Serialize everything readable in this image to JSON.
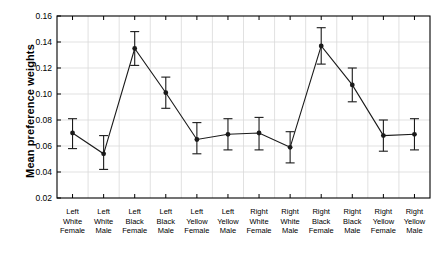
{
  "chart_data": {
    "type": "line",
    "title": "",
    "xlabel": "",
    "ylabel": "Mean preference weights",
    "ylim": [
      0.02,
      0.16
    ],
    "ytick_values": [
      0.02,
      0.04,
      0.06,
      0.08,
      0.1,
      0.12,
      0.14,
      0.16
    ],
    "ytick_labels": [
      "0.02",
      "0.04",
      "0.06",
      "0.08",
      "0.10",
      "0.12",
      "0.14",
      "0.16"
    ],
    "grid": true,
    "legend": "none",
    "error_bars": true,
    "marker": "filled-circle",
    "categories": [
      "Left\nWhite\nFemale",
      "Left\nWhite\nMale",
      "Left\nBlack\nFemale",
      "Left\nBlack\nMale",
      "Left\nYellow\nFemale",
      "Left\nYellow\nMale",
      "Right\nWhite\nFemale",
      "Right\nWhite\nMale",
      "Right\nBlack\nFemale",
      "Right\nBlack\nMale",
      "Right\nYellow\nFemale",
      "Right\nYellow\nMale"
    ],
    "category_lines": [
      [
        "Left",
        "White",
        "Female"
      ],
      [
        "Left",
        "White",
        "Male"
      ],
      [
        "Left",
        "Black",
        "Female"
      ],
      [
        "Left",
        "Black",
        "Male"
      ],
      [
        "Left",
        "Yellow",
        "Female"
      ],
      [
        "Left",
        "Yellow",
        "Male"
      ],
      [
        "Right",
        "White",
        "Female"
      ],
      [
        "Right",
        "White",
        "Male"
      ],
      [
        "Right",
        "Black",
        "Female"
      ],
      [
        "Right",
        "Black",
        "Male"
      ],
      [
        "Right",
        "Yellow",
        "Female"
      ],
      [
        "Right",
        "Yellow",
        "Male"
      ]
    ],
    "values": [
      0.07,
      0.054,
      0.135,
      0.101,
      0.065,
      0.069,
      0.07,
      0.059,
      0.137,
      0.107,
      0.068,
      0.069
    ],
    "err_low": [
      0.058,
      0.042,
      0.122,
      0.089,
      0.054,
      0.057,
      0.057,
      0.047,
      0.123,
      0.094,
      0.056,
      0.057
    ],
    "err_high": [
      0.081,
      0.068,
      0.148,
      0.113,
      0.078,
      0.081,
      0.082,
      0.071,
      0.151,
      0.12,
      0.08,
      0.081
    ],
    "series_color": "#1a1a1a",
    "grid_color": "#d9d9d9",
    "axis_color": "#000000"
  }
}
